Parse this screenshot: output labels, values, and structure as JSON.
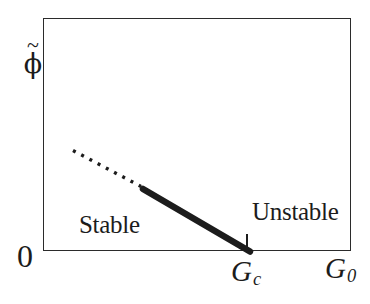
{
  "figure": {
    "background": "#ffffff",
    "ink": "#1c1c1c",
    "frame_color": "#2b2b2b",
    "y_axis": {
      "tilde": "~",
      "symbol": "ϕ"
    },
    "origin": "0",
    "regions": {
      "stable": "Stable",
      "unstable": "Unstable"
    },
    "critical_point": {
      "letter": "G",
      "sub": "c"
    },
    "x_axis": {
      "letter": "G",
      "sub": "0"
    }
  },
  "chart_data": {
    "type": "line",
    "title": "",
    "xlabel": "G0",
    "ylabel": "phi-tilde",
    "grid": false,
    "legend": false,
    "x_ticks": [
      {
        "label": "0",
        "position_frac": 0.0
      },
      {
        "label": "Gc",
        "position_frac": 0.66
      }
    ],
    "annotations": [
      {
        "text": "Stable",
        "placement": "inside plot, lower left of curve"
      },
      {
        "text": "Unstable",
        "placement": "inside plot, right of critical point above axis"
      }
    ],
    "series": [
      {
        "name": "stable-branch",
        "style": "dotted",
        "points_frac": [
          [
            0.097,
            0.43
          ],
          [
            0.317,
            0.273
          ]
        ]
      },
      {
        "name": "critical-branch",
        "style": "thick-solid",
        "points_frac": [
          [
            0.324,
            0.262
          ],
          [
            0.67,
            0.0
          ]
        ]
      }
    ],
    "segments_px": [
      {
        "name": "dotted-branch-line",
        "x1": 73,
        "y1": 150.5,
        "x2": 141,
        "y2": 186.5,
        "width": 3.4,
        "dash": "3 6.3",
        "cap": "butt"
      },
      {
        "name": "thick-branch-line",
        "x1": 143,
        "y1": 189,
        "x2": 250,
        "y2": 251.5,
        "width": 6.5,
        "dash": "",
        "cap": "round"
      },
      {
        "name": "gc-tick-mark",
        "x1": 247,
        "y1": 234,
        "x2": 247,
        "y2": 250,
        "width": 2,
        "dash": "",
        "cap": "butt"
      }
    ]
  }
}
